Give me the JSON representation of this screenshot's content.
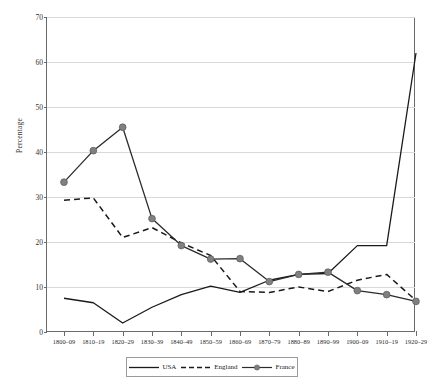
{
  "chart_data": {
    "type": "line",
    "title": "",
    "xlabel": "",
    "ylabel": "Percentage",
    "ylim": [
      0,
      70
    ],
    "yticks": [
      0,
      10,
      20,
      30,
      40,
      50,
      60,
      70
    ],
    "grid": true,
    "legend_position": "bottom",
    "categories": [
      "1800–09",
      "1810–19",
      "1820–29",
      "1830–39",
      "1840–49",
      "1850–59",
      "1860–69",
      "1870–79",
      "1880–89",
      "1890–99",
      "1900–09",
      "1910–19",
      "1920–29"
    ],
    "series": [
      {
        "name": "USA",
        "style": "solid",
        "marker": "none",
        "color": "#1a1a1a",
        "values": [
          7.5,
          6.5,
          2.0,
          5.5,
          8.3,
          10.2,
          8.8,
          11.5,
          12.8,
          13.0,
          19.2,
          19.2,
          62.0
        ]
      },
      {
        "name": "England",
        "style": "dashed",
        "marker": "none",
        "color": "#1a1a1a",
        "values": [
          29.3,
          29.8,
          21.0,
          23.2,
          19.8,
          17.0,
          9.0,
          8.8,
          10.0,
          9.0,
          11.5,
          12.8,
          7.0
        ]
      },
      {
        "name": "France",
        "style": "solid",
        "marker": "circle",
        "color": "#2b2b2b",
        "marker_color": "#808080",
        "values": [
          33.3,
          40.3,
          45.5,
          25.2,
          19.2,
          16.2,
          16.3,
          11.2,
          12.8,
          13.3,
          9.2,
          8.3,
          6.8
        ]
      }
    ]
  },
  "legend": {
    "items": [
      {
        "label": "USA"
      },
      {
        "label": "England"
      },
      {
        "label": "France"
      }
    ]
  },
  "axes": {
    "y_title": "Percentage"
  }
}
